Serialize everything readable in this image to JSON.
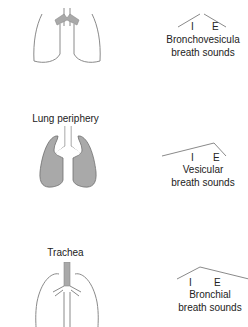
{
  "diagram": {
    "panels": [
      {
        "site": "",
        "highlight": "main-bronchi",
        "sound_name_line1": "Bronchovesicula",
        "sound_name_line2": "breath sounds",
        "inspiration_label": "I",
        "expiration_label": "E"
      },
      {
        "site": "Lung periphery",
        "highlight": "lung-tissue",
        "sound_name_line1": "Vesicular",
        "sound_name_line2": "breath sounds",
        "inspiration_label": "I",
        "expiration_label": "E"
      },
      {
        "site": "Trachea",
        "highlight": "trachea",
        "sound_name_line1": "Bronchial",
        "sound_name_line2": "breath sounds",
        "inspiration_label": "I",
        "expiration_label": "E"
      }
    ],
    "colors": {
      "outline": "#8a8a8a",
      "shade": "#a9a9a9",
      "text": "#222222"
    }
  }
}
